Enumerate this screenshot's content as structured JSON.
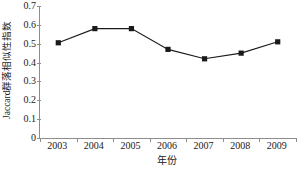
{
  "chart_data": {
    "type": "line",
    "title": "",
    "subtitle": "",
    "xlabel": "年份",
    "ylabel": "Jaccard群落相似性指数",
    "categories": [
      "2003",
      "2004",
      "2005",
      "2006",
      "2007",
      "2008",
      "2009"
    ],
    "values": [
      0.505,
      0.58,
      0.58,
      0.47,
      0.42,
      0.45,
      0.51
    ],
    "series": [
      {
        "name": "Jaccard群落相似性指数",
        "values": [
          0.505,
          0.58,
          0.58,
          0.47,
          0.42,
          0.45,
          0.51
        ]
      }
    ],
    "ylim": [
      0,
      0.7
    ],
    "yticks": [
      0,
      0.1,
      0.2,
      0.3,
      0.4,
      0.5,
      0.6,
      0.7
    ],
    "ytick_labels": [
      "0",
      "0.1",
      "0.2",
      "0.3",
      "0.4",
      "0.5",
      "0.6",
      "0.7"
    ],
    "grid": false,
    "legend": "none",
    "marker": "square",
    "colors": {
      "line": "#1a1a1a",
      "marker": "#1a1a1a",
      "axis": "#8d8d8d",
      "text": "#1a1a1a",
      "background": "#ffffff"
    }
  }
}
